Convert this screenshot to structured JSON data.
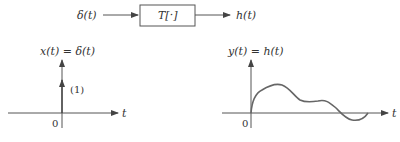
{
  "block_diagram": {
    "input_label": "δ(t)",
    "system_label": "T[·]",
    "output_label": "h(t)"
  },
  "left_plot": {
    "title": "x(t) = δ(t)",
    "impulse_weight_label": "(1)",
    "origin_label": "0",
    "x_axis_label": "t"
  },
  "right_plot": {
    "title": "y(t) = h(t)",
    "origin_label": "0",
    "x_axis_label": "t",
    "curve_description": "impulse response: rises from 0, peak, dips, second smaller hump, crosses below zero, returns toward zero"
  },
  "colors": {
    "line": "#555555",
    "text": "#333333"
  }
}
